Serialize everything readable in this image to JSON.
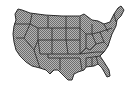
{
  "map": {
    "subject": "United States state outline map",
    "style": "grayscale dithered states with dark borders",
    "colors": {
      "background": "#ffffff",
      "state_fill": "#9a9a9a",
      "state_border": "#2a2a2a"
    }
  }
}
